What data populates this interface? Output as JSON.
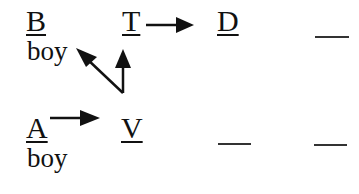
{
  "diagram": {
    "nodes": {
      "B": {
        "letter": "B",
        "label": "boy"
      },
      "T": {
        "letter": "T"
      },
      "D": {
        "letter": "D"
      },
      "A": {
        "letter": "A",
        "label": "boy"
      },
      "V": {
        "letter": "V"
      }
    },
    "blanks": [
      {
        "row": 1,
        "position": 4
      },
      {
        "row": 2,
        "position": 3
      },
      {
        "row": 2,
        "position": 4
      }
    ],
    "arrows": [
      {
        "from": "T",
        "to": "D"
      },
      {
        "from": "A",
        "to": "V"
      },
      {
        "from": "V",
        "to": "B"
      },
      {
        "from": "V",
        "to": "T"
      }
    ]
  }
}
